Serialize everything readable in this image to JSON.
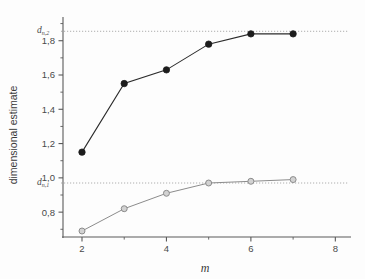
{
  "chart_data": {
    "type": "line",
    "title": "",
    "subtitle": "",
    "xlabel": "m",
    "ylabel": "dimensional estimate",
    "xlim": [
      1.55,
      8.3
    ],
    "ylim": [
      0.655,
      1.915
    ],
    "grid": false,
    "legend": "none",
    "x": [
      2,
      3,
      4,
      5,
      6,
      7
    ],
    "x_ticks_major": [
      2,
      4,
      6,
      8
    ],
    "x_ticks_major_labels": [
      "2",
      "4",
      "6",
      "8"
    ],
    "x_ticks_minor": [
      3,
      5,
      7
    ],
    "y_ticks_major": [
      0.8,
      1.0,
      1.2,
      1.4,
      1.6,
      1.8
    ],
    "y_ticks_major_labels": [
      "0,8",
      "1,0",
      "1,2",
      "1,4",
      "1,6",
      "1,8"
    ],
    "y_ticks_minor": [
      0.7,
      0.9,
      1.1,
      1.3,
      1.5,
      1.7,
      1.9
    ],
    "series": [
      {
        "name": "upper estimate",
        "marker": "filled-circle",
        "color": "#1c1c1c",
        "values": [
          1.15,
          1.55,
          1.63,
          1.78,
          1.84,
          1.84
        ]
      },
      {
        "name": "lower estimate",
        "marker": "open-circle",
        "color": "#8c8c8c",
        "values": [
          0.69,
          0.82,
          0.91,
          0.97,
          0.98,
          0.99
        ]
      }
    ],
    "reference_lines": [
      {
        "name": "d_n_2",
        "label_base": "d",
        "label_sub": "n,2",
        "value": 1.855,
        "style": "dotted",
        "color": "#9a9a9a"
      },
      {
        "name": "d_n_1",
        "label_base": "d",
        "label_sub": "n,1",
        "value": 0.97,
        "style": "dotted",
        "color": "#9a9a9a"
      }
    ]
  },
  "axes": {
    "x_title": "m",
    "y_title": "dimensional estimate"
  }
}
